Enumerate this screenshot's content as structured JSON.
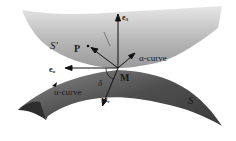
{
  "figure": {
    "surfaces": {
      "upper": {
        "label": "S′",
        "color": "#b8b8b8"
      },
      "lower": {
        "label": "S",
        "color": "#5a5a5a"
      }
    },
    "point_M": "M",
    "point_P": "P",
    "vectors": {
      "e3": {
        "base": "e",
        "sub": "3"
      },
      "eu": {
        "base": "e",
        "sub": "u"
      },
      "ev": {
        "base": "e",
        "sub": "v"
      }
    },
    "curves": {
      "alpha": "α-curve",
      "u": "u-curve"
    },
    "angle": "δ"
  }
}
